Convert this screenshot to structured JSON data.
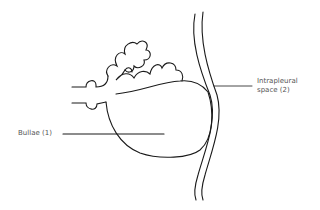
{
  "diagram": {
    "labels": [
      {
        "id": "bullae",
        "text": "Bullae (1)"
      },
      {
        "id": "intrapleural",
        "line1": "Intrapleural",
        "line2": "space (2)"
      }
    ],
    "colors": {
      "stroke": "#1a1a1a",
      "text": "#555555",
      "background": "#ffffff"
    }
  }
}
